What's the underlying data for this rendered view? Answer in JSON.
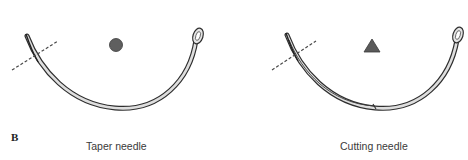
{
  "figure": {
    "panel_label": "B",
    "needles": [
      {
        "name": "taper",
        "caption": "Taper needle",
        "cross_section_shape": "circle",
        "cross_section_color": "#5f5f5f"
      },
      {
        "name": "cutting",
        "caption": "Cutting needle",
        "cross_section_shape": "triangle",
        "cross_section_color": "#5a5a5a"
      }
    ],
    "colors": {
      "outline": "#2e2e2e",
      "body_fill": "#dcdcdc",
      "dashed_line": "#4a4a4a"
    }
  }
}
